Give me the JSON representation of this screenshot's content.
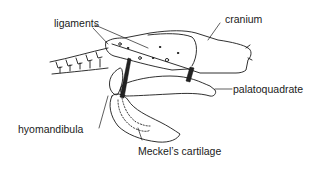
{
  "diagram": {
    "labels": {
      "ligaments": "ligaments",
      "cranium": "cranium",
      "palatoquadrate": "palatoquadrate",
      "hyomandibula": "hyomandibula",
      "meckels_cartilage": "Meckel’s cartilage"
    },
    "colors": {
      "line": "#1a1a1a",
      "background": "#ffffff",
      "ligament_fill": "#222222"
    }
  }
}
